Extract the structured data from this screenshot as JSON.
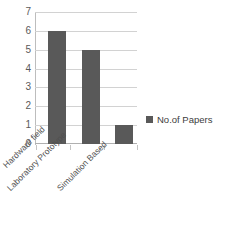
{
  "chart_data": {
    "type": "bar",
    "title": "",
    "subtitle": "",
    "xlabel": "",
    "ylabel": "",
    "categories": [
      "Hardware field",
      "Laboratory Prototype",
      "Simulation Based"
    ],
    "series": [
      {
        "name": "No.of Papers",
        "values": [
          6,
          5,
          1
        ],
        "color": "#595959"
      }
    ],
    "ylim": [
      0,
      7
    ],
    "ytick_labels": [
      "0",
      "1",
      "2",
      "3",
      "4",
      "5",
      "6",
      "7"
    ],
    "ytick_values": [
      0,
      1,
      2,
      3,
      4,
      5,
      6,
      7
    ],
    "grid": true,
    "grid_axis": "y",
    "legend": {
      "position": "right",
      "entries": [
        {
          "label": "No.of Papers",
          "color": "#595959",
          "marker": "square"
        }
      ]
    },
    "xtick_label_rotation": -45,
    "background_color": "#ffffff",
    "grid_color": "#d2d2d2",
    "axis_color": "#bdbdbd",
    "tick_label_color": "#5a5a5a"
  }
}
